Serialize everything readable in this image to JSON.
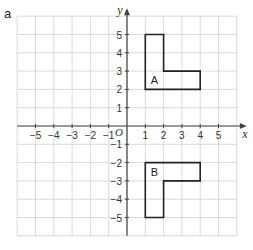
{
  "part_label": "a",
  "axes": {
    "x_label": "x",
    "y_label": "y",
    "origin_label": "O",
    "x_ticks": [
      "−5",
      "−4",
      "−3",
      "−2",
      "−1",
      "1",
      "2",
      "3",
      "4",
      "5"
    ],
    "x_tick_values": [
      -5,
      -4,
      -3,
      -2,
      -1,
      1,
      2,
      3,
      4,
      5
    ],
    "y_ticks": [
      "5",
      "4",
      "3",
      "2",
      "1",
      "−1",
      "−2",
      "−3",
      "−4",
      "−5"
    ],
    "y_tick_values": [
      5,
      4,
      3,
      2,
      1,
      -1,
      -2,
      -3,
      -4,
      -5
    ],
    "range": [
      -6,
      6
    ]
  },
  "shapes": [
    {
      "label": "A",
      "points": [
        [
          1,
          2
        ],
        [
          1,
          5
        ],
        [
          2,
          5
        ],
        [
          2,
          3
        ],
        [
          4,
          3
        ],
        [
          4,
          2
        ]
      ],
      "label_pos": [
        1.5,
        2.5
      ]
    },
    {
      "label": "B",
      "points": [
        [
          1,
          -2
        ],
        [
          1,
          -5
        ],
        [
          2,
          -5
        ],
        [
          2,
          -3
        ],
        [
          4,
          -3
        ],
        [
          4,
          -2
        ]
      ],
      "label_pos": [
        1.5,
        -2.5
      ]
    }
  ],
  "colors": {
    "grid": "#d0d0d0",
    "axis": "#444444",
    "shape": "#222222",
    "text": "#333333"
  }
}
